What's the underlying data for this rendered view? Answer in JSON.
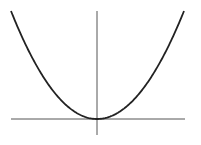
{
  "figure": {
    "function": "y = x^2",
    "vertex": [
      0,
      0
    ],
    "colors": {
      "background": "#ffffff",
      "curve": "#222222",
      "axes": "#555555"
    },
    "axes": {
      "x_axis": {
        "x1": 11,
        "x2": 185,
        "y": 119
      },
      "y_axis": {
        "x": 97,
        "y1": 11,
        "y2": 135
      }
    },
    "curve": {
      "left_top": [
        11,
        11
      ],
      "vertex_px": [
        97,
        119
      ],
      "right_top": [
        184,
        11
      ]
    }
  }
}
